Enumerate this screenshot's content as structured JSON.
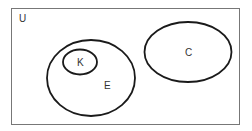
{
  "diagram": {
    "type": "venn",
    "universe": {
      "label": "U"
    },
    "sets": [
      {
        "id": "E",
        "label": "E"
      },
      {
        "id": "K",
        "label": "K",
        "subset_of": "E"
      },
      {
        "id": "C",
        "label": "C",
        "disjoint_with": "E"
      }
    ],
    "colors": {
      "stroke": "#1a1a1a",
      "border": "#777777",
      "text": "#333333"
    }
  }
}
